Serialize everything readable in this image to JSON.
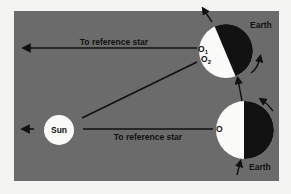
{
  "colors": {
    "page_background": "#f4f4f2",
    "panel": "#6b6b6b",
    "day_side": "#fbfbf9",
    "night_side": "#121212",
    "line": "#111111",
    "label": "#111111"
  },
  "labels": {
    "top_ray": "To reference star",
    "bottom_ray": "To reference star",
    "sun": "Sun",
    "earth_top": "Earth",
    "earth_bottom": "Earth",
    "point_o": "O",
    "point_o1": "O",
    "point_o1_sub": "1",
    "point_o2": "O",
    "point_o2_sub": "2"
  },
  "icons": {
    "left_arrow_top": "arrow-left-icon",
    "left_arrow_sun": "arrow-left-icon",
    "orbit_arrow": "arrow-up-icon",
    "rotation_arrow": "curved-arrow-icon"
  }
}
